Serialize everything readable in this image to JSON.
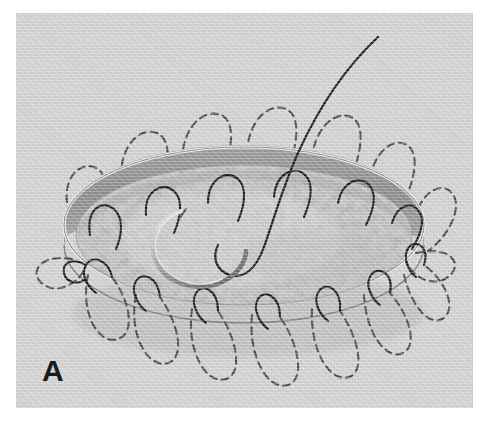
{
  "figure": {
    "panel_label": "A",
    "caption_text": "",
    "width_px": 488,
    "height_px": 424
  },
  "plate": {
    "left_px": 16,
    "top_px": 13,
    "width_px": 457,
    "height_px": 395,
    "background_color": "#d2d2d2",
    "page_margin_color": "#ffffff"
  },
  "colors": {
    "page_background": "#ffffff",
    "photo_background": "#d2d2d2",
    "ring_rim_highlight": "#e3e3e3",
    "ring_outer_band": "#b9b9b9",
    "ring_dark_band": "#8f8f8f",
    "ring_inner_shadow": "#a7a7a7",
    "ring_outline": "#6e6e6e",
    "tissue_fill": "#c9c9c9",
    "tissue_mottle_light": "#dcdcdc",
    "tissue_mottle_dark": "#b4b4b4",
    "suture_visible": "#1d1d1d",
    "suture_hidden_dashed": "#4a4a4a",
    "needle_metal_light": "#e6e6e6",
    "needle_metal_dark": "#5c5c5c",
    "drop_shadow": "#b0b0b0",
    "panel_letter": "#1b1b1b"
  },
  "ring": {
    "name": "annuloplasty-ring",
    "center_x_px": 245,
    "center_y_px": 228,
    "radius_x_px": 180,
    "radius_y_px": 78,
    "band_height_px": 34,
    "description": "elliptical prosthetic ring seen in oblique perspective, dark sewing cuff band on far wall"
  },
  "sutures": {
    "name": "interrupted-sutures",
    "visible_count": 15,
    "hidden_dashed_count": 15,
    "dash_pattern": "7 5",
    "stroke_width_px": 2.1,
    "description": "mattress sutures looping through the ring; hidden segments rendered as dashed loops outside the ring"
  },
  "needle": {
    "name": "curved-surgical-needle",
    "tip_x_px": 165,
    "tip_y_px": 210,
    "curvature": "half-circle, 3/8 arc",
    "thread_top_x_px": 378,
    "thread_top_y_px": 37,
    "description": "curved needle with attached suture thread rising out of frame toward upper right"
  },
  "annotations": {
    "panel_letter_font_size_px": 30,
    "panel_letter_weight": "bold"
  },
  "chart_data": {
    "type": "diagram",
    "elements": [
      "elliptical annuloplasty ring",
      "dark sewing-cuff band",
      "15 visible suture arcs over ring edge",
      "15 dashed hidden suture loops",
      "curved surgical needle",
      "suture thread tail exiting upper right"
    ]
  }
}
